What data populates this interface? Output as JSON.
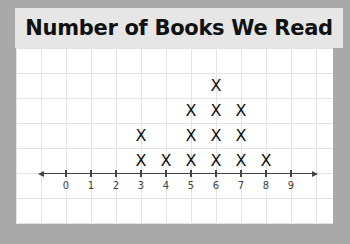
{
  "title": "Number of Books We Read",
  "colors": {
    "frame": "#a9a9a9",
    "title_bg": "#e6e6e6",
    "panel_bg": "#ffffff",
    "grid": "#e3e3e3",
    "axis": "#444444",
    "mark": "#111111"
  },
  "mark_symbol": "X",
  "chart_data": {
    "type": "scatter",
    "subtype": "line_plot",
    "title": "Number of Books We Read",
    "xlabel": "",
    "ylabel": "",
    "categories": [
      0,
      1,
      2,
      3,
      4,
      5,
      6,
      7,
      8,
      9
    ],
    "tick_labels": [
      "0",
      "1",
      "2",
      "3",
      "4",
      "5",
      "6",
      "7",
      "8",
      "9"
    ],
    "values": [
      0,
      0,
      0,
      2,
      1,
      3,
      4,
      3,
      1,
      0
    ],
    "marker": "X",
    "xlim": [
      0,
      9
    ],
    "grid": true,
    "legend": null
  }
}
